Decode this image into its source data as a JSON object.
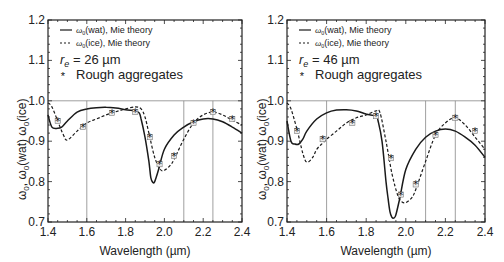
{
  "chart_data": [
    {
      "type": "line",
      "panel": "left",
      "title": "",
      "xlabel": "Wavelength (µm)",
      "ylabel": "ω0, ω0(wat) ω0(ice)",
      "xlim": [
        1.4,
        2.4
      ],
      "ylim": [
        0.7,
        1.2
      ],
      "xticks": [
        "1.4",
        "1.6",
        "1.8",
        "2.0",
        "2.2",
        "2.4"
      ],
      "yticks": [
        "0.7",
        "0.8",
        "0.9",
        "1.0",
        "1.1",
        "1.2"
      ],
      "grid": false,
      "reference_lines": {
        "horizontal": [
          1.0
        ],
        "vertical": [
          1.6,
          2.1,
          2.25
        ]
      },
      "annotation": "r_e = 26 µm",
      "legend": [
        "ω0(wat), Mie theory",
        "ω0(ice), Mie theory",
        "Rough aggregates"
      ],
      "legend_position": "upper left",
      "series": [
        {
          "name": "ω0(wat), Mie theory",
          "style": "solid",
          "x": [
            1.4,
            1.42,
            1.45,
            1.47,
            1.5,
            1.55,
            1.6,
            1.65,
            1.7,
            1.75,
            1.8,
            1.85,
            1.87,
            1.88,
            1.9,
            1.92,
            1.93,
            1.94,
            1.95,
            1.97,
            2.0,
            2.05,
            2.1,
            2.15,
            2.2,
            2.25,
            2.3,
            2.35,
            2.4
          ],
          "y": [
            0.965,
            0.935,
            0.932,
            0.935,
            0.95,
            0.972,
            0.98,
            0.983,
            0.984,
            0.982,
            0.978,
            0.975,
            0.97,
            0.955,
            0.91,
            0.85,
            0.81,
            0.798,
            0.8,
            0.83,
            0.88,
            0.915,
            0.935,
            0.948,
            0.955,
            0.955,
            0.948,
            0.935,
            0.92
          ]
        },
        {
          "name": "ω0(ice), Mie theory",
          "style": "dashed",
          "x": [
            1.4,
            1.42,
            1.45,
            1.48,
            1.5,
            1.55,
            1.6,
            1.65,
            1.7,
            1.75,
            1.8,
            1.85,
            1.88,
            1.9,
            1.92,
            1.95,
            1.98,
            2.0,
            2.03,
            2.05,
            2.1,
            2.15,
            2.2,
            2.25,
            2.3,
            2.35,
            2.4
          ],
          "y": [
            0.995,
            0.985,
            0.95,
            0.915,
            0.903,
            0.925,
            0.945,
            0.955,
            0.965,
            0.973,
            0.98,
            0.985,
            0.98,
            0.96,
            0.92,
            0.86,
            0.83,
            0.828,
            0.84,
            0.855,
            0.905,
            0.945,
            0.965,
            0.972,
            0.965,
            0.952,
            0.94
          ]
        },
        {
          "name": "Rough aggregates",
          "style": "markers",
          "x": [
            1.45,
            1.58,
            1.73,
            1.85,
            1.925,
            1.975,
            2.05,
            2.15,
            2.25,
            2.35
          ],
          "y": [
            0.95,
            0.935,
            0.97,
            0.972,
            0.91,
            0.843,
            0.863,
            0.945,
            0.972,
            0.955
          ]
        }
      ]
    },
    {
      "type": "line",
      "panel": "right",
      "title": "",
      "xlabel": "Wavelength (µm)",
      "ylabel": "ω0, ω0(wat) ω0(ice)",
      "xlim": [
        1.4,
        2.4
      ],
      "ylim": [
        0.7,
        1.2
      ],
      "xticks": [
        "1.4",
        "1.6",
        "1.8",
        "2.0",
        "2.2",
        "2.4"
      ],
      "yticks": [
        "0.7",
        "0.8",
        "0.9",
        "1.0",
        "1.1",
        "1.2"
      ],
      "grid": false,
      "reference_lines": {
        "horizontal": [
          1.0
        ],
        "vertical": [
          1.6,
          2.1,
          2.25
        ]
      },
      "annotation": "r_e = 46 µm",
      "legend": [
        "ω0(wat), Mie theory",
        "ω0(ice), Mie theory",
        "Rough aggregates"
      ],
      "legend_position": "upper left",
      "series": [
        {
          "name": "ω0(wat), Mie theory",
          "style": "solid",
          "x": [
            1.4,
            1.42,
            1.44,
            1.46,
            1.48,
            1.5,
            1.55,
            1.6,
            1.65,
            1.7,
            1.75,
            1.8,
            1.85,
            1.86,
            1.88,
            1.9,
            1.91,
            1.92,
            1.93,
            1.94,
            1.95,
            1.97,
            2.0,
            2.05,
            2.1,
            2.15,
            2.2,
            2.25,
            2.3,
            2.35,
            2.4
          ],
          "y": [
            0.95,
            0.9,
            0.893,
            0.893,
            0.905,
            0.925,
            0.955,
            0.97,
            0.977,
            0.978,
            0.975,
            0.967,
            0.962,
            0.95,
            0.9,
            0.8,
            0.76,
            0.725,
            0.712,
            0.71,
            0.718,
            0.76,
            0.83,
            0.88,
            0.91,
            0.925,
            0.93,
            0.925,
            0.91,
            0.89,
            0.86
          ]
        },
        {
          "name": "ω0(ice), Mie theory",
          "style": "dashed",
          "x": [
            1.4,
            1.42,
            1.45,
            1.48,
            1.5,
            1.53,
            1.55,
            1.58,
            1.6,
            1.65,
            1.7,
            1.75,
            1.8,
            1.85,
            1.87,
            1.9,
            1.93,
            1.96,
            1.98,
            2.0,
            2.03,
            2.05,
            2.1,
            2.15,
            2.2,
            2.25,
            2.3,
            2.35,
            2.4
          ],
          "y": [
            0.995,
            0.98,
            0.93,
            0.87,
            0.848,
            0.86,
            0.88,
            0.895,
            0.905,
            0.925,
            0.945,
            0.958,
            0.965,
            0.975,
            0.97,
            0.9,
            0.82,
            0.765,
            0.75,
            0.748,
            0.76,
            0.78,
            0.85,
            0.915,
            0.945,
            0.958,
            0.94,
            0.91,
            0.88
          ]
        },
        {
          "name": "Rough aggregates",
          "style": "markers",
          "x": [
            1.45,
            1.58,
            1.73,
            1.85,
            1.925,
            1.975,
            2.05,
            2.15,
            2.25,
            2.35
          ],
          "y": [
            0.925,
            0.905,
            0.945,
            0.962,
            0.858,
            0.768,
            0.793,
            0.915,
            0.958,
            0.925
          ]
        }
      ]
    }
  ],
  "legend_labels": {
    "wat_prefix": "ω",
    "wat_sub": "0",
    "wat_suffix": "(wat), Mie theory",
    "ice_prefix": "ω",
    "ice_sub": "0",
    "ice_suffix": "(ice), Mie theory",
    "aggregates": "Rough aggregates",
    "marker": "*"
  },
  "panels": {
    "left": {
      "re_label": "r",
      "re_sub": "e",
      "re_value": " = 26 µm"
    },
    "right": {
      "re_label": "r",
      "re_sub": "e",
      "re_value": " = 46 µm"
    }
  },
  "axes": {
    "xlabel": "Wavelength (µm)",
    "ylabel": "ω0, ω0(wat) ω0(ice)",
    "ylabel_parts": [
      "ω",
      "0",
      ", ω",
      "0",
      "(wat) ω",
      "0",
      "(ice)"
    ]
  },
  "colors": {
    "line": "#1a1a1a",
    "reference": "#888888",
    "frame": "#222222"
  }
}
